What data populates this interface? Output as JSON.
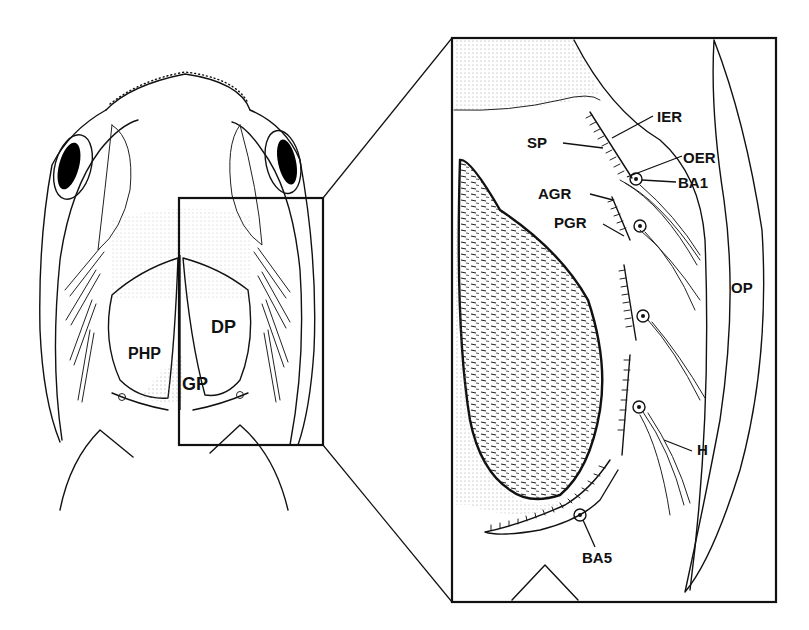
{
  "figure": {
    "type": "anatomical line drawing",
    "colors": {
      "ink": "#111111",
      "background": "#ffffff",
      "stipple": "#555555"
    }
  },
  "overview": {
    "labels": {
      "php": "PHP",
      "dp": "DP",
      "gp": "GP"
    },
    "zoom_box": {
      "x": 179,
      "y": 198,
      "width": 144,
      "height": 247
    }
  },
  "inset": {
    "box": {
      "x": 452,
      "y": 38,
      "width": 324,
      "height": 564
    },
    "labels": {
      "ier": "IER",
      "sp": "SP",
      "oer": "OER",
      "ba1": "BA1",
      "agr": "AGR",
      "pgr": "PGR",
      "op": "OP",
      "h": "H",
      "ba5": "BA5"
    }
  }
}
